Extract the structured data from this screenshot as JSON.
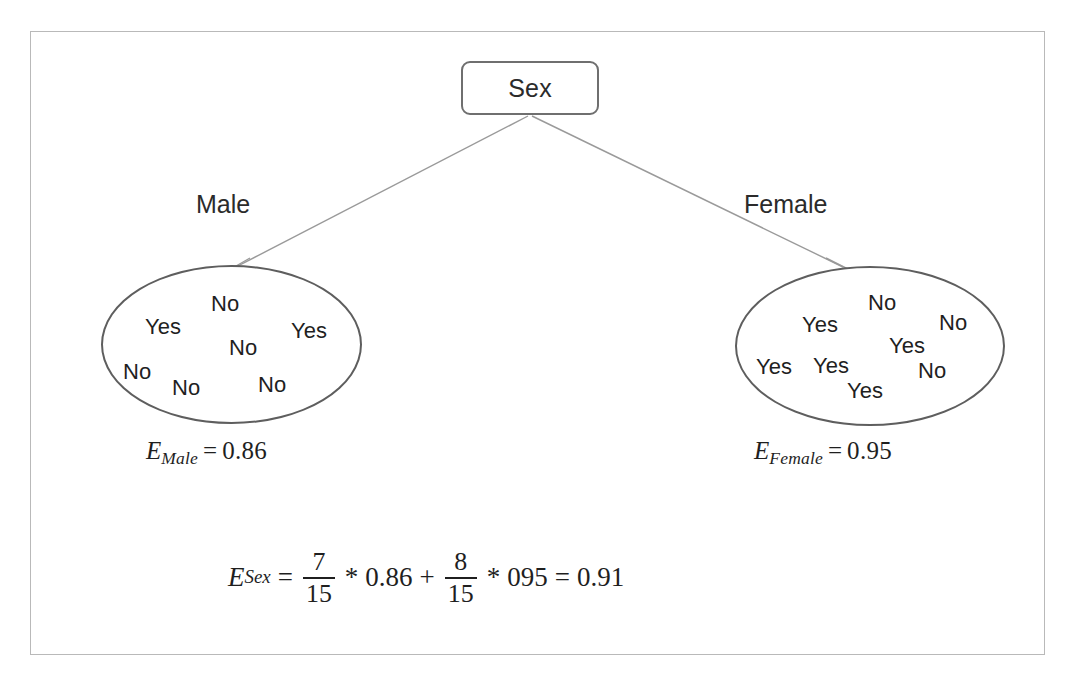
{
  "figure": {
    "root": {
      "label": "Sex"
    },
    "branches": [
      {
        "name": "male-branch",
        "label": "Male"
      },
      {
        "name": "female-branch",
        "label": "Female"
      }
    ],
    "leaves": [
      {
        "name": "male-leaf",
        "items": [
          {
            "text": "No",
            "x": 108,
            "y": 24
          },
          {
            "text": "Yes",
            "x": 42,
            "y": 47
          },
          {
            "text": "Yes",
            "x": 188,
            "y": 51
          },
          {
            "text": "No",
            "x": 126,
            "y": 68
          },
          {
            "text": "No",
            "x": 20,
            "y": 92
          },
          {
            "text": "No",
            "x": 69,
            "y": 108
          },
          {
            "text": "No",
            "x": 155,
            "y": 105
          }
        ],
        "counts": {
          "yes": 2,
          "no": 5,
          "total": 7
        }
      },
      {
        "name": "female-leaf",
        "items": [
          {
            "text": "No",
            "x": 131,
            "y": 22
          },
          {
            "text": "Yes",
            "x": 65,
            "y": 44
          },
          {
            "text": "No",
            "x": 202,
            "y": 42
          },
          {
            "text": "Yes",
            "x": 152,
            "y": 65
          },
          {
            "text": "Yes",
            "x": 19,
            "y": 86
          },
          {
            "text": "Yes",
            "x": 76,
            "y": 85
          },
          {
            "text": "No",
            "x": 181,
            "y": 90
          },
          {
            "text": "Yes",
            "x": 110,
            "y": 110
          }
        ],
        "counts": {
          "yes": 5,
          "no": 3,
          "total": 8
        }
      }
    ],
    "entropy_male": {
      "symbol": "E",
      "subscript": "Male",
      "equals": "=",
      "value": "0.86"
    },
    "entropy_female": {
      "symbol": "E",
      "subscript": "Female",
      "equals": "=",
      "value": "0.95"
    },
    "equation": {
      "symbol": "E",
      "subscript": "Sex",
      "equals": "=",
      "frac1_num": "7",
      "frac1_den": "15",
      "mult1": "*",
      "term1": "0.86",
      "plus": "+",
      "frac2_num": "8",
      "frac2_den": "15",
      "mult2": "*",
      "term2": "095",
      "equals2": "=",
      "result": "0.91"
    },
    "colors": {
      "frame_border": "#b9b9b9",
      "node_border": "#6f6f6f",
      "ellipse_border": "#5e5e5e",
      "edge_stroke": "#9a9a9a",
      "text": "#1f1f1f"
    }
  },
  "chart_data": {
    "type": "diagram",
    "root_attribute": "Sex",
    "branches": [
      {
        "value": "Male",
        "labels": [
          "No",
          "Yes",
          "Yes",
          "No",
          "No",
          "No",
          "No"
        ],
        "yes": 2,
        "no": 5,
        "total": 7,
        "entropy": 0.86
      },
      {
        "value": "Female",
        "labels": [
          "No",
          "Yes",
          "No",
          "Yes",
          "Yes",
          "Yes",
          "No",
          "Yes"
        ],
        "yes": 5,
        "no": 3,
        "total": 8,
        "entropy": 0.95
      }
    ],
    "weighted_entropy": 0.91,
    "grand_total": 15,
    "formula": "E_Sex = 7/15 * 0.86 + 8/15 * 095 = 0.91"
  }
}
